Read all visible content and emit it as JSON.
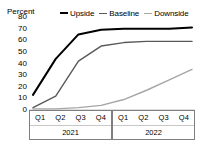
{
  "chart_data": {
    "type": "line",
    "title": "",
    "subtitle": "",
    "ylabel": "Percent",
    "xlabel": "",
    "ylim": [
      0,
      80
    ],
    "yticks": [
      80,
      70,
      60,
      50,
      40,
      30,
      20,
      10,
      0
    ],
    "grid": false,
    "legend_position": "top",
    "x": [
      "Q1",
      "Q2",
      "Q3",
      "Q4",
      "Q1",
      "Q2",
      "Q3",
      "Q4"
    ],
    "x_groups": [
      {
        "label": "2021",
        "categories": [
          "Q1",
          "Q2",
          "Q3",
          "Q4"
        ]
      },
      {
        "label": "2022",
        "categories": [
          "Q1",
          "Q2",
          "Q3",
          "Q4"
        ]
      }
    ],
    "series": [
      {
        "name": "Upside",
        "color": "#000000",
        "width": 2.0,
        "values": [
          13,
          44,
          65,
          69,
          70,
          70,
          70,
          71
        ]
      },
      {
        "name": "Baseline",
        "color": "#595959",
        "width": 1.4,
        "values": [
          2,
          12,
          42,
          55,
          58,
          59,
          59,
          59
        ]
      },
      {
        "name": "Downside",
        "color": "#a6a6a6",
        "width": 1.4,
        "values": [
          1,
          1,
          2,
          4,
          9,
          17,
          26,
          35
        ]
      }
    ]
  }
}
